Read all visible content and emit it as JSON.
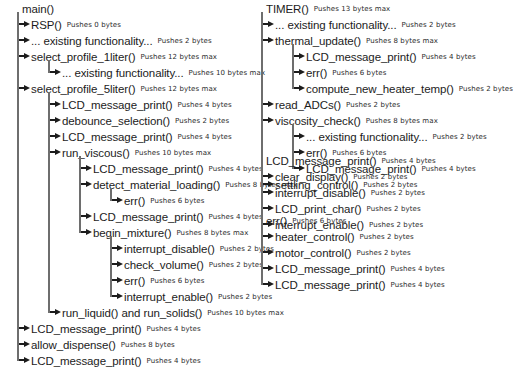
{
  "diagram": {
    "trees": [
      {
        "id": "main",
        "root": {
          "name": "main()",
          "annotation": ""
        },
        "nodes": [
          {
            "depth": 1,
            "name": "RSP()",
            "annotation": "Pushes 0 bytes"
          },
          {
            "depth": 1,
            "name": "... existing functionality...",
            "annotation": "Pushes 2 bytes"
          },
          {
            "depth": 1,
            "name": "select_profile_1liter()",
            "annotation": "Pushes 12 bytes max"
          },
          {
            "depth": 2,
            "name": "... existing functionality...",
            "annotation": "Pushes 10 bytes max",
            "last": true
          },
          {
            "depth": 1,
            "name": "select_profile_5liter()",
            "annotation": "Pushes 12 bytes max"
          },
          {
            "depth": 2,
            "name": "LCD_message_print()",
            "annotation": "Pushes 4 bytes"
          },
          {
            "depth": 2,
            "name": "debounce_selection()",
            "annotation": "Pushes 2 bytes"
          },
          {
            "depth": 2,
            "name": "LCD_message_print()",
            "annotation": "Pushes 4 bytes"
          },
          {
            "depth": 2,
            "name": "run_viscous()",
            "annotation": "Pushes 10 bytes max"
          },
          {
            "depth": 3,
            "name": "LCD_message_print()",
            "annotation": "Pushes 4 bytes"
          },
          {
            "depth": 3,
            "name": "detect_material_loading()",
            "annotation": "Pushes 8 bytes max"
          },
          {
            "depth": 4,
            "name": "err()",
            "annotation": "Pushes 6 bytes",
            "last": true
          },
          {
            "depth": 3,
            "name": "LCD_message_print()",
            "annotation": "Pushes 4 bytes"
          },
          {
            "depth": 3,
            "name": "begin_mixture()",
            "annotation": "Pushes 8 bytes max",
            "last": true
          },
          {
            "depth": 4,
            "name": "interrupt_disable()",
            "annotation": "Pushes 2 bytes"
          },
          {
            "depth": 4,
            "name": "check_volume()",
            "annotation": "Pushes 2 bytes"
          },
          {
            "depth": 4,
            "name": "err()",
            "annotation": "Pushes 6 bytes"
          },
          {
            "depth": 4,
            "name": "interrupt_enable()",
            "annotation": "Pushes 2 bytes",
            "last": true
          },
          {
            "depth": 2,
            "name": "run_liquid() and run_solids()",
            "annotation": "Pushes 10 bytes max",
            "last": true
          },
          {
            "depth": 1,
            "name": "LCD_message_print()",
            "annotation": "Pushes 4 bytes"
          },
          {
            "depth": 1,
            "name": "allow_dispense()",
            "annotation": "Pushes 8 bytes"
          },
          {
            "depth": 1,
            "name": "LCD_message_print()",
            "annotation": "Pushes 4 bytes",
            "last": true
          }
        ]
      },
      {
        "id": "timer",
        "root": {
          "name": "TIMER()",
          "annotation": "Pushes 13 bytes max"
        },
        "nodes": [
          {
            "depth": 1,
            "name": "... existing functionality...",
            "annotation": "Pushes 2 bytes"
          },
          {
            "depth": 1,
            "name": "thermal_update()",
            "annotation": "Pushes 8 bytes max"
          },
          {
            "depth": 2,
            "name": "LCD_message_print()",
            "annotation": "Pushes 4 bytes"
          },
          {
            "depth": 2,
            "name": "err()",
            "annotation": "Pushes 6 bytes"
          },
          {
            "depth": 2,
            "name": "compute_new_heater_temp()",
            "annotation": "Pushes 2 bytes",
            "last": true
          },
          {
            "depth": 1,
            "name": "read_ADCs()",
            "annotation": "Pushes 2 bytes"
          },
          {
            "depth": 1,
            "name": "viscosity_check()",
            "annotation": "Pushes 8 bytes max"
          },
          {
            "depth": 2,
            "name": "... existing functionality...",
            "annotation": "Pushes 2 bytes"
          },
          {
            "depth": 2,
            "name": "err()",
            "annotation": "Pushes 6 bytes"
          },
          {
            "depth": 2,
            "name": "LCD_message_print()",
            "annotation": "Pushes 4 bytes",
            "last": true
          },
          {
            "depth": 1,
            "name": "settling_control()",
            "annotation": "Pushes 2 bytes",
            "last": true
          }
        ]
      },
      {
        "id": "lcd",
        "root": {
          "name": "LCD_message_print()",
          "annotation": "Pushes 4 bytes"
        },
        "nodes": [
          {
            "depth": 1,
            "name": "clear_display()",
            "annotation": "Pushes 2 bytes"
          },
          {
            "depth": 1,
            "name": "interrupt_disable()",
            "annotation": "Pushes 2 bytes"
          },
          {
            "depth": 1,
            "name": "LCD_print_char()",
            "annotation": "Pushes 2 bytes"
          },
          {
            "depth": 1,
            "name": "interrupt_enable()",
            "annotation": "Pushes 2 bytes",
            "last": true
          }
        ]
      },
      {
        "id": "err",
        "root": {
          "name": "err()",
          "annotation": "Pushes 6 bytes"
        },
        "nodes": [
          {
            "depth": 1,
            "name": "heater_control()",
            "annotation": "Pushes 2 bytes"
          },
          {
            "depth": 1,
            "name": "motor_control()",
            "annotation": "Pushes 2 bytes"
          },
          {
            "depth": 1,
            "name": "LCD_message_print()",
            "annotation": "Pushes 4 bytes"
          },
          {
            "depth": 1,
            "name": "LCD_message_print()",
            "annotation": "Pushes 4 bytes",
            "last": true
          }
        ]
      }
    ]
  }
}
